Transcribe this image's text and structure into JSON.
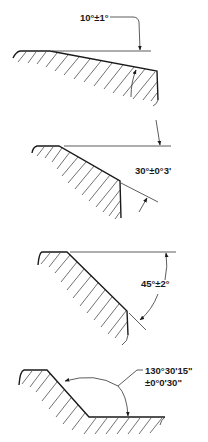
{
  "figure": {
    "views": [
      {
        "id": "view-1",
        "angle_label": "10°±1°",
        "nominal_deg": 10,
        "tolerance": "±1°"
      },
      {
        "id": "view-2",
        "angle_label": "30°±0°3'",
        "nominal_deg": 30,
        "tolerance": "±0°3'"
      },
      {
        "id": "view-3",
        "angle_label": "45°±2°",
        "nominal_deg": 45,
        "tolerance": "±2°"
      },
      {
        "id": "view-4",
        "angle_label_line1": "130°30'15\"",
        "angle_label_line2": "±0°0'30\"",
        "nominal": "130°30'15\"",
        "tolerance": "±0°0'30\""
      }
    ]
  }
}
